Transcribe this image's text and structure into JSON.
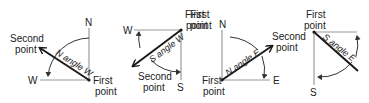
{
  "panels": [
    {
      "id": "n-angle-w",
      "angle_label": "N angle W",
      "first_point": {
        "line1": "First",
        "line2": "point"
      },
      "second_point": {
        "line1": "Second",
        "line2": "point"
      },
      "direction_labels": {
        "vertical": "N",
        "horizontal": "W"
      }
    },
    {
      "id": "s-angle-w",
      "angle_label": "S angle W",
      "first_point": {
        "line1": "First",
        "line2": "point"
      },
      "second_point": {
        "line1": "Second",
        "line2": "point"
      },
      "direction_labels": {
        "vertical": "S",
        "horizontal": "W"
      }
    },
    {
      "id": "n-angle-e",
      "angle_label": "N angle E",
      "first_point": {
        "line1": "First",
        "line2": "point"
      },
      "second_point": {
        "line1": "Second",
        "line2": "point"
      },
      "direction_labels": {
        "vertical": "N",
        "horizontal": "E"
      }
    },
    {
      "id": "s-angle-e",
      "angle_label": "S angle E",
      "first_point": {
        "line1": "First",
        "line2": "point"
      },
      "direction_labels": {
        "vertical": "S"
      }
    }
  ],
  "colors": {
    "axis": "#9a9a9a",
    "bearing": "#1a1a1a",
    "text": "#222222",
    "background": "#ffffff"
  }
}
